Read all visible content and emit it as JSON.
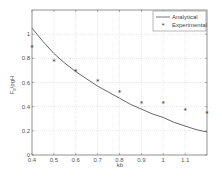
{
  "chart_data": {
    "type": "line",
    "title": "",
    "xlabel": "kb",
    "ylabel": "F_s/ρgH",
    "xlim": [
      0.4,
      1.2
    ],
    "ylim": [
      0,
      1.2
    ],
    "xticks": [
      0.4,
      0.5,
      0.6,
      0.7,
      0.8,
      0.9,
      1,
      1.1
    ],
    "xtick_labels": [
      "0.4",
      "0.5",
      "0.6",
      "0.7",
      "0.8",
      "0.9",
      "1",
      "1.1"
    ],
    "yticks": [
      0,
      0.2,
      0.4,
      0.6,
      0.8,
      1
    ],
    "ytick_labels": [
      "0",
      "0.2",
      "0.4",
      "0.6",
      "0.8",
      "1"
    ],
    "grid": true,
    "legend_position": "upper right",
    "series": [
      {
        "name": "Analytical",
        "style": "line",
        "color": "#555555",
        "x": [
          0.4,
          0.45,
          0.5,
          0.55,
          0.6,
          0.65,
          0.7,
          0.75,
          0.8,
          0.85,
          0.9,
          0.95,
          1.0,
          1.05,
          1.1,
          1.15,
          1.2
        ],
        "y": [
          1.05,
          0.94,
          0.84,
          0.76,
          0.69,
          0.63,
          0.57,
          0.52,
          0.47,
          0.42,
          0.38,
          0.34,
          0.31,
          0.27,
          0.24,
          0.21,
          0.19
        ]
      },
      {
        "name": "Experimental",
        "style": "marker",
        "marker": "*",
        "color": "#333333",
        "x": [
          0.4,
          0.5,
          0.6,
          0.7,
          0.8,
          0.9,
          1.0,
          1.1,
          1.2
        ],
        "y": [
          0.89,
          0.78,
          0.69,
          0.61,
          0.52,
          0.43,
          0.43,
          0.37,
          0.35
        ]
      }
    ]
  },
  "legend": {
    "items": [
      {
        "label": "Analytical"
      },
      {
        "label": "Experimental"
      }
    ]
  },
  "axes": {
    "xlabel": "kb",
    "ylabel_main": "F",
    "ylabel_sub": "s",
    "ylabel_rest": "/ρgH"
  }
}
